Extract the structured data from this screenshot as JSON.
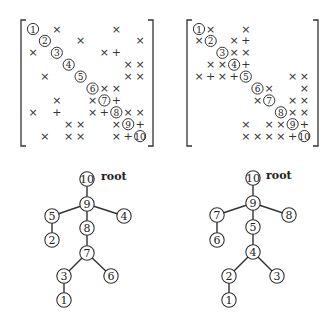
{
  "matrices": [
    {
      "name": "original-matrix",
      "origin": [
        33,
        29
      ],
      "step": [
        11.9,
        11.9
      ],
      "bracket": {
        "left": 21,
        "right": 153,
        "top": 20,
        "bottom": 146
      },
      "entries": [
        {
          "r": 1,
          "c": 1,
          "t": "d",
          "v": "1"
        },
        {
          "r": 1,
          "c": 3,
          "t": "x"
        },
        {
          "r": 1,
          "c": 8,
          "t": "x"
        },
        {
          "r": 2,
          "c": 2,
          "t": "d",
          "v": "2"
        },
        {
          "r": 2,
          "c": 5,
          "t": "x"
        },
        {
          "r": 2,
          "c": 10,
          "t": "x"
        },
        {
          "r": 3,
          "c": 1,
          "t": "x"
        },
        {
          "r": 3,
          "c": 3,
          "t": "d",
          "v": "3"
        },
        {
          "r": 3,
          "c": 7,
          "t": "x"
        },
        {
          "r": 3,
          "c": 8,
          "t": "+"
        },
        {
          "r": 4,
          "c": 4,
          "t": "d",
          "v": "4"
        },
        {
          "r": 4,
          "c": 9,
          "t": "x"
        },
        {
          "r": 4,
          "c": 10,
          "t": "x"
        },
        {
          "r": 5,
          "c": 2,
          "t": "x"
        },
        {
          "r": 5,
          "c": 5,
          "t": "d",
          "v": "5"
        },
        {
          "r": 5,
          "c": 9,
          "t": "x"
        },
        {
          "r": 5,
          "c": 10,
          "t": "x"
        },
        {
          "r": 6,
          "c": 6,
          "t": "d",
          "v": "6"
        },
        {
          "r": 6,
          "c": 7,
          "t": "x"
        },
        {
          "r": 6,
          "c": 8,
          "t": "x"
        },
        {
          "r": 7,
          "c": 3,
          "t": "x"
        },
        {
          "r": 7,
          "c": 6,
          "t": "x"
        },
        {
          "r": 7,
          "c": 7,
          "t": "d",
          "v": "7"
        },
        {
          "r": 7,
          "c": 8,
          "t": "+"
        },
        {
          "r": 8,
          "c": 1,
          "t": "x"
        },
        {
          "r": 8,
          "c": 3,
          "t": "+"
        },
        {
          "r": 8,
          "c": 6,
          "t": "x"
        },
        {
          "r": 8,
          "c": 7,
          "t": "+"
        },
        {
          "r": 8,
          "c": 8,
          "t": "d",
          "v": "8"
        },
        {
          "r": 8,
          "c": 9,
          "t": "x"
        },
        {
          "r": 8,
          "c": 10,
          "t": "x"
        },
        {
          "r": 9,
          "c": 4,
          "t": "x"
        },
        {
          "r": 9,
          "c": 5,
          "t": "x"
        },
        {
          "r": 9,
          "c": 8,
          "t": "x"
        },
        {
          "r": 9,
          "c": 9,
          "t": "d",
          "v": "9"
        },
        {
          "r": 9,
          "c": 10,
          "t": "+"
        },
        {
          "r": 10,
          "c": 2,
          "t": "x"
        },
        {
          "r": 10,
          "c": 4,
          "t": "x"
        },
        {
          "r": 10,
          "c": 5,
          "t": "x"
        },
        {
          "r": 10,
          "c": 8,
          "t": "x"
        },
        {
          "r": 10,
          "c": 9,
          "t": "+"
        },
        {
          "r": 10,
          "c": 10,
          "t": "d",
          "v": "10"
        }
      ]
    },
    {
      "name": "reordered-matrix",
      "origin": [
        199,
        29
      ],
      "step": [
        11.7,
        11.9
      ],
      "bracket": {
        "left": 187,
        "right": 318,
        "top": 20,
        "bottom": 146
      },
      "entries": [
        {
          "r": 1,
          "c": 1,
          "t": "d",
          "v": "1"
        },
        {
          "r": 1,
          "c": 2,
          "t": "x"
        },
        {
          "r": 1,
          "c": 5,
          "t": "x"
        },
        {
          "r": 2,
          "c": 1,
          "t": "x"
        },
        {
          "r": 2,
          "c": 2,
          "t": "d",
          "v": "2"
        },
        {
          "r": 2,
          "c": 4,
          "t": "x"
        },
        {
          "r": 2,
          "c": 5,
          "t": "+"
        },
        {
          "r": 3,
          "c": 3,
          "t": "d",
          "v": "3"
        },
        {
          "r": 3,
          "c": 4,
          "t": "x"
        },
        {
          "r": 3,
          "c": 5,
          "t": "x"
        },
        {
          "r": 4,
          "c": 2,
          "t": "x"
        },
        {
          "r": 4,
          "c": 3,
          "t": "x"
        },
        {
          "r": 4,
          "c": 4,
          "t": "d",
          "v": "4"
        },
        {
          "r": 4,
          "c": 5,
          "t": "+"
        },
        {
          "r": 5,
          "c": 1,
          "t": "x"
        },
        {
          "r": 5,
          "c": 2,
          "t": "+"
        },
        {
          "r": 5,
          "c": 3,
          "t": "x"
        },
        {
          "r": 5,
          "c": 4,
          "t": "+"
        },
        {
          "r": 5,
          "c": 5,
          "t": "d",
          "v": "5"
        },
        {
          "r": 5,
          "c": 9,
          "t": "x"
        },
        {
          "r": 5,
          "c": 10,
          "t": "x"
        },
        {
          "r": 6,
          "c": 6,
          "t": "d",
          "v": "6"
        },
        {
          "r": 6,
          "c": 7,
          "t": "x"
        },
        {
          "r": 6,
          "c": 10,
          "t": "x"
        },
        {
          "r": 7,
          "c": 6,
          "t": "x"
        },
        {
          "r": 7,
          "c": 7,
          "t": "d",
          "v": "7"
        },
        {
          "r": 7,
          "c": 9,
          "t": "x"
        },
        {
          "r": 7,
          "c": 10,
          "t": "x"
        },
        {
          "r": 8,
          "c": 8,
          "t": "d",
          "v": "8"
        },
        {
          "r": 8,
          "c": 9,
          "t": "x"
        },
        {
          "r": 8,
          "c": 10,
          "t": "x"
        },
        {
          "r": 9,
          "c": 5,
          "t": "x"
        },
        {
          "r": 9,
          "c": 7,
          "t": "x"
        },
        {
          "r": 9,
          "c": 8,
          "t": "x"
        },
        {
          "r": 9,
          "c": 9,
          "t": "d",
          "v": "9"
        },
        {
          "r": 9,
          "c": 10,
          "t": "+"
        },
        {
          "r": 10,
          "c": 5,
          "t": "x"
        },
        {
          "r": 10,
          "c": 6,
          "t": "x"
        },
        {
          "r": 10,
          "c": 7,
          "t": "x"
        },
        {
          "r": 10,
          "c": 8,
          "t": "x"
        },
        {
          "r": 10,
          "c": 9,
          "t": "+"
        },
        {
          "r": 10,
          "c": 10,
          "t": "d",
          "v": "10"
        }
      ]
    }
  ],
  "trees": [
    {
      "name": "original-elimination-tree",
      "root_label": "root",
      "root_label_pos": [
        101,
        180
      ],
      "nodes": [
        {
          "id": "10",
          "x": 87,
          "y": 179
        },
        {
          "id": "9",
          "x": 87,
          "y": 204
        },
        {
          "id": "5",
          "x": 52,
          "y": 216
        },
        {
          "id": "4",
          "x": 124,
          "y": 216
        },
        {
          "id": "8",
          "x": 87,
          "y": 228
        },
        {
          "id": "2",
          "x": 52,
          "y": 240
        },
        {
          "id": "7",
          "x": 87,
          "y": 253
        },
        {
          "id": "3",
          "x": 64,
          "y": 276
        },
        {
          "id": "6",
          "x": 111,
          "y": 276
        },
        {
          "id": "1",
          "x": 64,
          "y": 300
        }
      ],
      "edges": [
        [
          "10",
          "9"
        ],
        [
          "9",
          "5"
        ],
        [
          "9",
          "4"
        ],
        [
          "9",
          "8"
        ],
        [
          "5",
          "2"
        ],
        [
          "8",
          "7"
        ],
        [
          "7",
          "3"
        ],
        [
          "7",
          "6"
        ],
        [
          "3",
          "1"
        ]
      ]
    },
    {
      "name": "reordered-elimination-tree",
      "root_label": "root",
      "root_label_pos": [
        266,
        179
      ],
      "nodes": [
        {
          "id": "10",
          "x": 253,
          "y": 178
        },
        {
          "id": "9",
          "x": 253,
          "y": 203
        },
        {
          "id": "7",
          "x": 217,
          "y": 215
        },
        {
          "id": "8",
          "x": 289,
          "y": 215
        },
        {
          "id": "5",
          "x": 253,
          "y": 227
        },
        {
          "id": "6",
          "x": 217,
          "y": 240
        },
        {
          "id": "4",
          "x": 253,
          "y": 252
        },
        {
          "id": "2",
          "x": 229,
          "y": 276
        },
        {
          "id": "3",
          "x": 277,
          "y": 276
        },
        {
          "id": "1",
          "x": 229,
          "y": 300
        }
      ],
      "edges": [
        [
          "10",
          "9"
        ],
        [
          "9",
          "7"
        ],
        [
          "9",
          "8"
        ],
        [
          "9",
          "5"
        ],
        [
          "7",
          "6"
        ],
        [
          "5",
          "4"
        ],
        [
          "4",
          "2"
        ],
        [
          "4",
          "3"
        ],
        [
          "2",
          "1"
        ]
      ]
    }
  ],
  "symbols": {
    "fill": "×",
    "fillin": "+"
  }
}
